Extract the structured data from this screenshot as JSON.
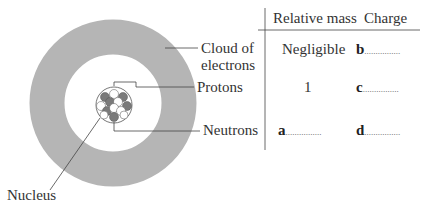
{
  "diagram": {
    "labels": {
      "cloud": "Cloud of electrons",
      "cloud_line1": "Cloud of",
      "cloud_line2": "electrons",
      "protons": "Protons",
      "neutrons": "Neutrons",
      "nucleus": "Nucleus"
    },
    "colors": {
      "cloud": "#b5b5b5",
      "proton": "#7a7a7a",
      "neutron": "#ffffff",
      "lines": "#444444"
    }
  },
  "table": {
    "headers": [
      "Relative mass",
      "Charge"
    ],
    "rows": [
      {
        "particle": "Cloud of electrons",
        "mass": "Negligible",
        "charge_letter": "b",
        "charge_dots": "................"
      },
      {
        "particle": "Protons",
        "mass": "1",
        "charge_letter": "c",
        "charge_dots": "................"
      },
      {
        "particle": "Neutrons",
        "mass_letter": "a",
        "mass_dots": "................",
        "charge_letter": "d",
        "charge_dots": "................"
      }
    ]
  }
}
